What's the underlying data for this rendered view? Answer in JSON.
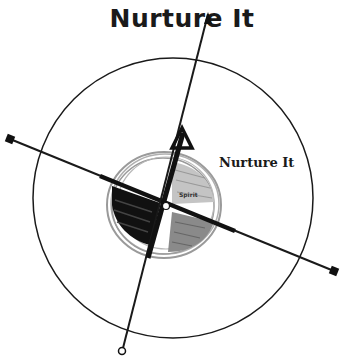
{
  "title": "Nurture It",
  "diagram": {
    "side_label": "Nurture It",
    "center_label": "Spirit",
    "elements": [
      "outer-circle",
      "inner-sketched-circle",
      "vertical-axis-arrow",
      "horizontal-diagonal-axis",
      "shaded-quadrants"
    ]
  }
}
